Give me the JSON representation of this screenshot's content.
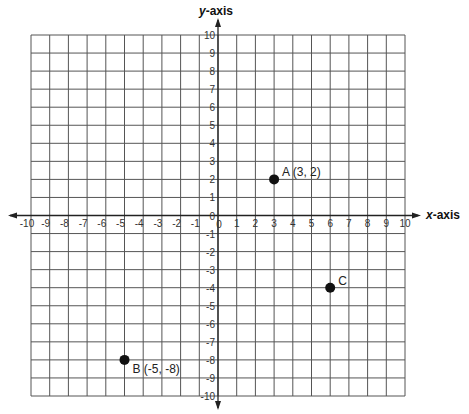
{
  "diagram": {
    "type": "coordinate-plane",
    "x_axis_label": {
      "italic": "x",
      "rest": "-axis"
    },
    "y_axis_label": {
      "italic": "y",
      "rest": "-axis"
    },
    "x_range": [
      -10,
      10
    ],
    "y_range": [
      -10,
      10
    ],
    "grid_step": 1,
    "x_ticks": [
      "-10",
      "-9",
      "-8",
      "-7",
      "-6",
      "-5",
      "-4",
      "-3",
      "-2",
      "-1",
      "0",
      "1",
      "2",
      "3",
      "4",
      "5",
      "6",
      "7",
      "8",
      "9",
      "10"
    ],
    "y_ticks": [
      "10",
      "9",
      "8",
      "7",
      "6",
      "5",
      "4",
      "3",
      "2",
      "1",
      "0",
      "-1",
      "-2",
      "-3",
      "-4",
      "-5",
      "-6",
      "-7",
      "-8",
      "-9",
      "-10"
    ],
    "origin_label": "0",
    "points": [
      {
        "name": "A",
        "x": 3,
        "y": 2,
        "label": "A (3, 2)",
        "label_pos": "upper-right"
      },
      {
        "name": "B",
        "x": -5,
        "y": -8,
        "label": "B (-5, -8)",
        "label_pos": "lower-right"
      },
      {
        "name": "C",
        "x": 6,
        "y": -4,
        "label": "C",
        "label_pos": "upper-right"
      }
    ],
    "colors": {
      "grid": "#555555",
      "axis": "#222222",
      "point": "#111111",
      "background": "#ffffff"
    }
  }
}
